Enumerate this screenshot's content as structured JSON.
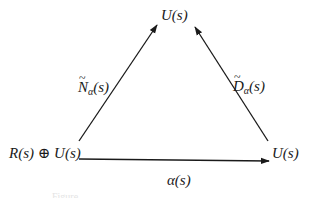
{
  "diagram": {
    "type": "commutative-triangle",
    "nodes": {
      "top": "U(s)",
      "bottom_left": "R(s) ⊕ U(s)",
      "bottom_right": "U(s)"
    },
    "edges": [
      {
        "from": "bottom_left",
        "to": "top",
        "label_base": "N",
        "label_sub": "α",
        "label_arg": "(s)",
        "label": "Ñα(s)"
      },
      {
        "from": "bottom_right",
        "to": "top",
        "label_base": "D",
        "label_sub": "α",
        "label_arg": "(s)",
        "label": "D̃α(s)"
      },
      {
        "from": "bottom_left",
        "to": "bottom_right",
        "label": "α(s)"
      }
    ],
    "tilde": "~",
    "caption": "Figure"
  },
  "colors": {
    "ink": "#1a1a1a",
    "background": "#ffffff",
    "caption": "#e4e4e4"
  }
}
